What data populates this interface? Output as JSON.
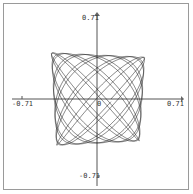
{
  "chart_data": {
    "type": "line",
    "title": "",
    "xlabel": "",
    "ylabel": "",
    "xlim": [
      -0.71,
      0.71
    ],
    "ylim": [
      -0.71,
      0.71
    ],
    "grid": false,
    "legend": null,
    "axis_tick_labels": {
      "x_min": "-0.71",
      "x_max": "0.71",
      "y_min": "-0.71",
      "y_max": "0.71",
      "origin": "0"
    },
    "series": [
      {
        "name": "curve",
        "description": "Dense Lissajous-type parametric curve filling a rounded region centered near origin, approx radius 0.40",
        "x_extent": [
          -0.38,
          0.41
        ],
        "y_extent": [
          -0.41,
          0.39
        ]
      }
    ]
  },
  "labels": {
    "y_max": "0.71",
    "y_min": "-0.71",
    "x_min": "-0.71",
    "x_max": "0.71",
    "origin": "0"
  },
  "colors": {
    "curve": "#1a1a1a",
    "axes": "#555555",
    "border": "#9a9a9a"
  }
}
